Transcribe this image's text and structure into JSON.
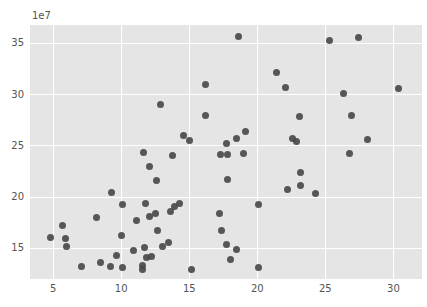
{
  "chart": {
    "offset_label": "1e7"
  },
  "chart_data": {
    "type": "scatter",
    "title": "",
    "xlabel": "",
    "ylabel": "",
    "x_ticks": [
      5,
      10,
      15,
      20,
      25,
      30
    ],
    "y_ticks": [
      15,
      20,
      25,
      30,
      35
    ],
    "y_offset_text": "1e7",
    "y_value_multiplier": 10000000,
    "xlim": [
      3.3,
      32.1
    ],
    "ylim": [
      12.0,
      36.8
    ],
    "grid": true,
    "legend": false,
    "style": {
      "figure_background": "#ffffff",
      "plot_background": "#e5e5e5",
      "grid_color": "#ffffff",
      "point_color": "#464646",
      "tick_label_color": "#555555",
      "point_diameter_px": 7
    },
    "points": [
      [
        18.6,
        35.7
      ],
      [
        25.3,
        35.3
      ],
      [
        27.4,
        35.6
      ],
      [
        21.4,
        32.2
      ],
      [
        16.2,
        31.0
      ],
      [
        22.1,
        30.7
      ],
      [
        30.4,
        30.6
      ],
      [
        26.3,
        30.1
      ],
      [
        12.9,
        29.0
      ],
      [
        16.2,
        28.0
      ],
      [
        23.1,
        27.9
      ],
      [
        26.9,
        28.0
      ],
      [
        14.6,
        26.0
      ],
      [
        15.0,
        25.5
      ],
      [
        17.7,
        25.2
      ],
      [
        18.5,
        25.7
      ],
      [
        19.1,
        26.4
      ],
      [
        28.1,
        25.6
      ],
      [
        22.6,
        25.7
      ],
      [
        22.9,
        25.4
      ],
      [
        26.8,
        24.3
      ],
      [
        11.65,
        24.4
      ],
      [
        13.75,
        24.1
      ],
      [
        17.3,
        24.2
      ],
      [
        17.8,
        24.2
      ],
      [
        19.0,
        24.3
      ],
      [
        12.1,
        23.0
      ],
      [
        23.2,
        22.4
      ],
      [
        17.8,
        21.7
      ],
      [
        12.6,
        21.6
      ],
      [
        23.2,
        21.1
      ],
      [
        22.2,
        20.7
      ],
      [
        24.3,
        20.3
      ],
      [
        9.3,
        20.4
      ],
      [
        10.1,
        19.3
      ],
      [
        11.8,
        19.4
      ],
      [
        20.1,
        19.3
      ],
      [
        13.9,
        19.1
      ],
      [
        14.3,
        19.4
      ],
      [
        13.6,
        18.6
      ],
      [
        17.25,
        18.4
      ],
      [
        12.5,
        18.4
      ],
      [
        12.1,
        18.1
      ],
      [
        8.2,
        18.0
      ],
      [
        11.1,
        17.7
      ],
      [
        5.7,
        17.2
      ],
      [
        17.4,
        16.75
      ],
      [
        12.7,
        16.7
      ],
      [
        4.8,
        16.1
      ],
      [
        5.9,
        16.0
      ],
      [
        10.0,
        16.2
      ],
      [
        6.0,
        15.2
      ],
      [
        11.7,
        15.1
      ],
      [
        13.0,
        15.2
      ],
      [
        13.45,
        15.6
      ],
      [
        17.75,
        15.4
      ],
      [
        18.45,
        14.9
      ],
      [
        9.65,
        14.3
      ],
      [
        10.9,
        14.8
      ],
      [
        11.85,
        14.1
      ],
      [
        12.2,
        14.15
      ],
      [
        8.5,
        13.6
      ],
      [
        18.0,
        13.9
      ],
      [
        7.1,
        13.2
      ],
      [
        9.2,
        13.2
      ],
      [
        10.1,
        13.1
      ],
      [
        11.6,
        13.3
      ],
      [
        11.6,
        12.9
      ],
      [
        15.2,
        12.9
      ],
      [
        20.1,
        13.1
      ]
    ]
  }
}
